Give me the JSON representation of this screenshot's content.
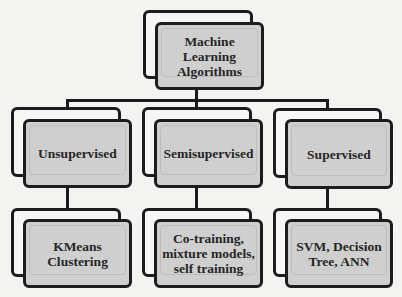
{
  "diagram": {
    "root": {
      "label": "Machine\nLearning\nAlgorithms"
    },
    "categories": [
      {
        "label": "Unsupervised",
        "example": {
          "label": "KMeans\nClustering"
        }
      },
      {
        "label": "Semisupervised",
        "example": {
          "label": "Co-training,\nmixture models,\nself training"
        }
      },
      {
        "label": "Supervised",
        "example": {
          "label": "SVM, Decision\nTree, ANN"
        }
      }
    ]
  },
  "colors": {
    "box_fill": "#cfcfcf",
    "box_border": "#1c1c1c",
    "background": "#f3f3f1"
  }
}
